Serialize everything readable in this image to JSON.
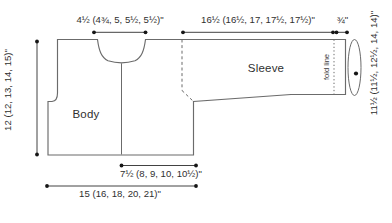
{
  "diagram": {
    "type": "knitting-pattern-schematic",
    "labels": {
      "body": "Body",
      "sleeve": "Sleeve",
      "fold_line": "fold line"
    },
    "measurements": {
      "neck_width": "4½ (4¾, 5, 5½, 5½)\"",
      "sleeve_length": "16½ (16½, 17, 17½, 17½)\"",
      "cuff_fold": "¾\"",
      "body_length": "12 (12, 13, 14, 15)\"",
      "sleeve_circumference": "11½ (11½, 12½, 14, 14)\"",
      "front_width": "7½ (8, 9, 10, 10½)\"",
      "body_width": "15 (16, 18, 20, 21)\""
    },
    "colors": {
      "background": "#ffffff",
      "outline": "#6b6b6b",
      "dimension_line": "#2c2c2c",
      "text": "#2f2f2f"
    }
  }
}
